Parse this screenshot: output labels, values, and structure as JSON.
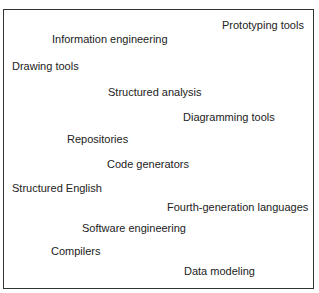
{
  "diagram": {
    "terms": [
      {
        "label": "Prototyping tools",
        "x": 222,
        "y": 19
      },
      {
        "label": "Information engineering",
        "x": 52,
        "y": 33
      },
      {
        "label": "Drawing tools",
        "x": 12,
        "y": 60
      },
      {
        "label": "Structured analysis",
        "x": 108,
        "y": 86
      },
      {
        "label": "Diagramming tools",
        "x": 183,
        "y": 111
      },
      {
        "label": "Repositories",
        "x": 67,
        "y": 133
      },
      {
        "label": "Code generators",
        "x": 107,
        "y": 158
      },
      {
        "label": "Structured English",
        "x": 12,
        "y": 182
      },
      {
        "label": "Fourth-generation languages",
        "x": 167,
        "y": 201
      },
      {
        "label": "Software engineering",
        "x": 82,
        "y": 222
      },
      {
        "label": "Compilers",
        "x": 51,
        "y": 245
      },
      {
        "label": "Data modeling",
        "x": 184,
        "y": 265
      }
    ]
  }
}
